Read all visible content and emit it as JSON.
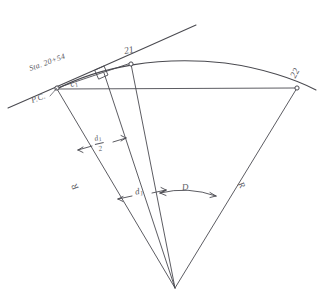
{
  "figure": {
    "kind": "hand-drawn engineering sketch",
    "background_color": "#ffffff",
    "ink_color": "#4a4a50"
  },
  "labels": {
    "station": "Sta. 20+54",
    "pc": "P.C.",
    "point_21": "21",
    "point_22": "22",
    "chord_c1_num": "c",
    "chord_c1_sub": "1",
    "half_deflection_num": "d",
    "half_deflection_num_sub": "1",
    "half_deflection_den": "2",
    "deflection_d1_num": "d",
    "deflection_d1_sub": "1",
    "central_angle": "D",
    "radius_left": "R",
    "radius_right": "R"
  },
  "geometry": {
    "pc_point": [
      57,
      88
    ],
    "point_21": [
      131,
      63
    ],
    "point_22": [
      297,
      88
    ],
    "center_point": [
      175,
      288
    ],
    "tangent_start": [
      8,
      107
    ],
    "tangent_end": [
      196,
      25
    ],
    "right_angle_marker": true,
    "radius_length_px": 211
  },
  "annotations": {
    "arrow_pairs": [
      "half-deflection dimension arrows",
      "deflection d1 dimension arrows",
      "central angle D arc arrows"
    ],
    "perpendicular_tick": "right-angle square at chord offset"
  }
}
